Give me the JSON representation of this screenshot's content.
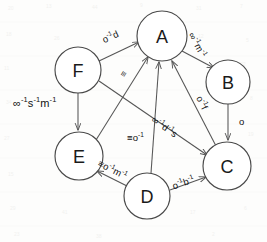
{
  "diagram": {
    "type": "directed-graph",
    "background_color": "#fdfdfc",
    "node_stroke_color": "#4a4a4a",
    "edge_stroke_color": "#555555",
    "text_color": "#111111",
    "nodes": [
      {
        "id": "A",
        "label": "A",
        "cx": 162,
        "cy": 36,
        "r": 25
      },
      {
        "id": "B",
        "label": "B",
        "cx": 228,
        "cy": 82,
        "r": 22
      },
      {
        "id": "C",
        "label": "C",
        "cx": 227,
        "cy": 166,
        "r": 24
      },
      {
        "id": "D",
        "label": "D",
        "cx": 147,
        "cy": 196,
        "r": 23
      },
      {
        "id": "E",
        "label": "E",
        "cx": 79,
        "cy": 156,
        "r": 24
      },
      {
        "id": "F",
        "label": "F",
        "cx": 78,
        "cy": 70,
        "r": 23
      }
    ],
    "edges": [
      {
        "id": "F-A",
        "from": "F",
        "to": "A",
        "label": "o-1d",
        "label_plain": "o⁻¹d"
      },
      {
        "id": "A-B",
        "from": "A",
        "to": "B",
        "label": "oo-1m-1",
        "label_plain": "∞⁻¹m⁻¹"
      },
      {
        "id": "B-C",
        "from": "B",
        "to": "C",
        "label": "o",
        "label_plain": "o"
      },
      {
        "id": "A-C",
        "from": "A",
        "to": "C",
        "label": "o-1f",
        "label_plain": "o⁻¹f"
      },
      {
        "id": "F-C",
        "from": "F",
        "to": "C",
        "label": "oo-1d-1s",
        "label_plain": "∞⁻¹d⁻¹s"
      },
      {
        "id": "F-E",
        "from": "F",
        "to": "E",
        "label": "oo-1s-1m-1",
        "label_plain": "∞⁻¹s⁻¹m⁻¹"
      },
      {
        "id": "E-A",
        "from": "E",
        "to": "A",
        "label": "=",
        "label_plain": "≡"
      },
      {
        "id": "D-A",
        "from": "D",
        "to": "A",
        "label": "=o-1",
        "label_plain": "≡o⁻¹"
      },
      {
        "id": "D-E",
        "from": "D",
        "to": "E",
        "label": "=o-1m-1",
        "label_plain": "≡o⁻¹m⁻¹"
      },
      {
        "id": "D-C",
        "from": "D",
        "to": "C",
        "label": "o-1b-1",
        "label_plain": "o⁻¹b⁻¹"
      }
    ]
  },
  "labels": {
    "node_a": "A",
    "node_b": "B",
    "node_c": "C",
    "node_d": "D",
    "node_e": "E",
    "node_f": "F",
    "edge_fa_base": "o",
    "edge_fa_sup": "-1",
    "edge_fa_tail": "d",
    "edge_ab_base": "∞",
    "edge_ab_sup1": "-1",
    "edge_ab_mid": "m",
    "edge_ab_sup2": "-1",
    "edge_bc": "o",
    "edge_ac_base": "o",
    "edge_ac_sup": "-1",
    "edge_ac_tail": "f",
    "edge_fc_base": "∞",
    "edge_fc_sup1": "-1",
    "edge_fc_mid": "d",
    "edge_fc_sup2": "-1",
    "edge_fc_tail": "s",
    "edge_fe_base": "∞",
    "edge_fe_sup1": "-1",
    "edge_fe_mid": "s",
    "edge_fe_sup2": "-1",
    "edge_fe_tail": "m",
    "edge_fe_sup3": "-1",
    "edge_ea": "≡",
    "edge_da_eq": "≡",
    "edge_da_base": "o",
    "edge_da_sup": "-1",
    "edge_de_eq": "≡",
    "edge_de_base": "o",
    "edge_de_sup1": "-1",
    "edge_de_mid": "m",
    "edge_de_sup2": "-1",
    "edge_dc_base": "o",
    "edge_dc_sup1": "-1",
    "edge_dc_mid": "b",
    "edge_dc_sup2": "-1"
  }
}
